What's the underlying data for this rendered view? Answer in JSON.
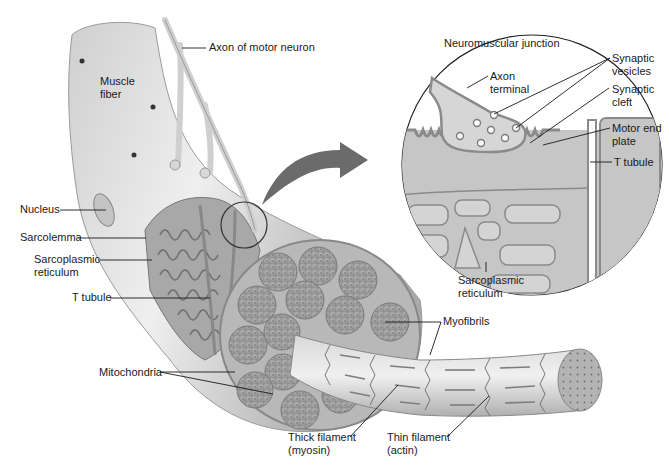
{
  "diagram": {
    "palette": {
      "background": "#ffffff",
      "fiber_light": "#e4e4e4",
      "fiber_mid": "#bdbdbd",
      "fiber_dark": "#8a8a8a",
      "myofibril": "#9a9a9a",
      "leader_line": "#1a1a1a",
      "arrow": "#6b6b6b",
      "inset_fill": "#c8c8c8",
      "axon_terminal_fill": "#d6d6d6"
    },
    "labels": {
      "axon_of_motor_neuron": "Axon of motor neuron",
      "muscle_fiber": "Muscle\nfiber",
      "nucleus": "Nucleus",
      "sarcolemma": "Sarcolemma",
      "sarcoplasmic_reticulum_left": "Sarcoplasmic\nreticulum",
      "t_tubule_left": "T tubule",
      "mitochondria": "Mitochondria",
      "thick_filament": "Thick filament\n(myosin)",
      "thin_filament": "Thin filament\n(actin)",
      "myofibrils": "Myofibrils",
      "inset_title": "Neuromuscular junction",
      "axon_terminal": "Axon\nterminal",
      "synaptic_vesicles": "Synaptic\nvesicles",
      "synaptic_cleft": "Synaptic\ncleft",
      "motor_end_plate": "Motor end\nplate",
      "t_tubule_right": "T tubule",
      "sarcoplasmic_reticulum_inset": "Sarcoplasmic\nreticulum"
    }
  }
}
